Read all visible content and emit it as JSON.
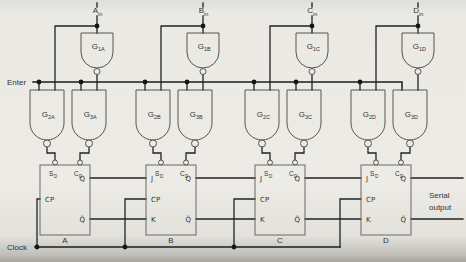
{
  "controls": {
    "enter": "Enter",
    "clock": "Clock",
    "serial_output_line1": "Serial",
    "serial_output_line2": "output"
  },
  "sections": [
    {
      "name": "A",
      "input": {
        "main": "A",
        "sub": "in"
      },
      "gate1": {
        "main": "G",
        "sub": "1A"
      },
      "gate2": {
        "main": "G",
        "sub": "2A"
      },
      "gate3": {
        "main": "G",
        "sub": "3A"
      },
      "ff": {
        "label": "A",
        "pin_sd_main": "S",
        "pin_sd_sub": "D",
        "pin_cd_main": "C",
        "pin_cd_sub": "D",
        "pin_cp": "CP",
        "pin_q": "Q",
        "pin_qbar": "Q̄"
      }
    },
    {
      "name": "B",
      "input": {
        "main": "B",
        "sub": "in"
      },
      "gate1": {
        "main": "G",
        "sub": "1B"
      },
      "gate2": {
        "main": "G",
        "sub": "2B"
      },
      "gate3": {
        "main": "G",
        "sub": "3B"
      },
      "ff": {
        "label": "B",
        "pin_sd_main": "S",
        "pin_sd_sub": "D",
        "pin_cd_main": "C",
        "pin_cd_sub": "D",
        "pin_j": "J",
        "pin_cp": "CP",
        "pin_k": "K",
        "pin_q": "Q",
        "pin_qbar": "Q̄"
      }
    },
    {
      "name": "C",
      "input": {
        "main": "C",
        "sub": "in"
      },
      "gate1": {
        "main": "G",
        "sub": "1C"
      },
      "gate2": {
        "main": "G",
        "sub": "2C"
      },
      "gate3": {
        "main": "G",
        "sub": "3C"
      },
      "ff": {
        "label": "C",
        "pin_sd_main": "S",
        "pin_sd_sub": "D",
        "pin_cd_main": "C",
        "pin_cd_sub": "D",
        "pin_j": "J",
        "pin_cp": "CP",
        "pin_k": "K",
        "pin_q": "Q",
        "pin_qbar": "Q̄"
      }
    },
    {
      "name": "D",
      "input": {
        "main": "D",
        "sub": "in"
      },
      "gate1": {
        "main": "G",
        "sub": "1D"
      },
      "gate2": {
        "main": "G",
        "sub": "2D"
      },
      "gate3": {
        "main": "G",
        "sub": "3D"
      },
      "ff": {
        "label": "D",
        "pin_sd_main": "S",
        "pin_sd_sub": "D",
        "pin_cd_main": "C",
        "pin_cd_sub": "D",
        "pin_j": "J",
        "pin_cp": "CP",
        "pin_k": "K",
        "pin_q": "Q",
        "pin_qbar": "Q̄"
      }
    }
  ]
}
